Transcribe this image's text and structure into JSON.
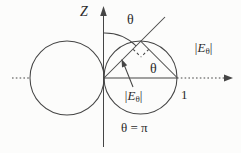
{
  "diagram": {
    "background": "#fcfcfb",
    "line_color": "#454545",
    "text_color": "#2b2b2b",
    "labels": {
      "z_axis": "Z",
      "theta_top": "θ",
      "theta_chord": "θ",
      "theta_bottom": "θ = π",
      "unit_radius": "1",
      "e_theta_outer": {
        "pre": "|E",
        "sub": "θ",
        "post": "|"
      },
      "e_theta_inner": {
        "pre": "|E",
        "sub": "θ",
        "post": "|"
      }
    }
  }
}
